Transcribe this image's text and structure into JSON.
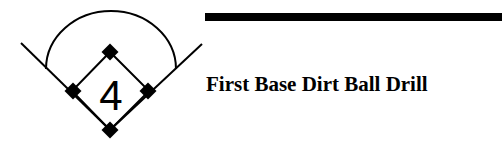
{
  "drill": {
    "number": "4",
    "title": "First Base Dirt Ball Drill"
  },
  "icon": {
    "name": "baseball-diamond-icon",
    "stroke_color": "#000000"
  },
  "header_bar": {
    "color": "#000000"
  }
}
